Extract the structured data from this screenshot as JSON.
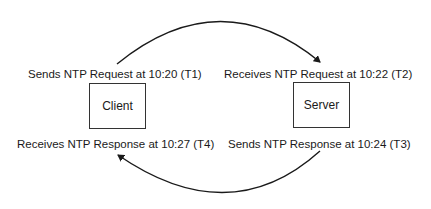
{
  "diagram": {
    "nodes": {
      "client": {
        "label": "Client"
      },
      "server": {
        "label": "Server"
      }
    },
    "labels": {
      "t1": "Sends NTP Request at 10:20 (T1)",
      "t2": "Receives NTP Request at 10:22 (T2)",
      "t3": "Sends NTP Response at 10:24 (T3)",
      "t4": "Receives NTP Response at 10:27 (T4)"
    },
    "edges": [
      {
        "from": "client",
        "to": "server",
        "meaning": "NTP Request",
        "direction": "top arc, left to right"
      },
      {
        "from": "server",
        "to": "client",
        "meaning": "NTP Response",
        "direction": "bottom arc, right to left"
      }
    ],
    "colors": {
      "line": "#1a1a1a",
      "text": "#1a1a1a",
      "background": "#ffffff"
    }
  }
}
